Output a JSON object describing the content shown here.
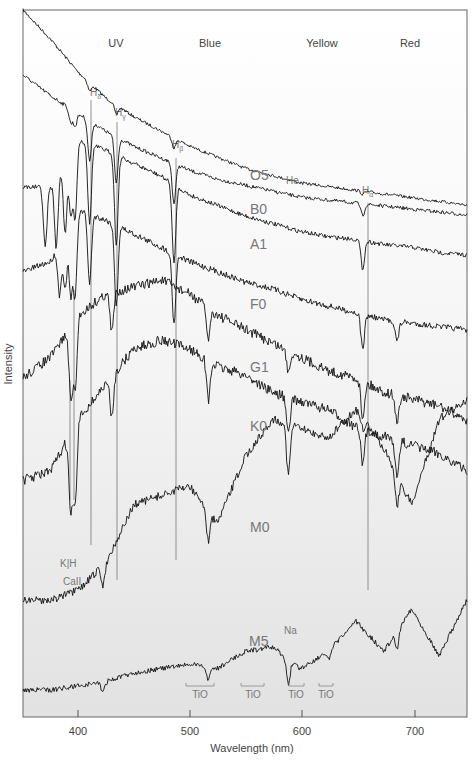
{
  "chart_data": {
    "type": "line",
    "title": "",
    "xlabel": "Wavelength (nm)",
    "ylabel": "Intensity",
    "xlim": [
      350,
      750
    ],
    "x_ticks": [
      400,
      500,
      600,
      700
    ],
    "grid": false,
    "legend": "none (series labels placed inline on curves)",
    "band_labels": [
      {
        "text": "UV",
        "x_nm": 390
      },
      {
        "text": "Blue",
        "x_nm": 487
      },
      {
        "text": "Yellow",
        "x_nm": 577
      },
      {
        "text": "Red",
        "x_nm": 660
      }
    ],
    "line_markers": [
      {
        "name": "Hδ",
        "base": "H",
        "sub": "δ",
        "x_nm": 410
      },
      {
        "name": "Hγ",
        "base": "H",
        "sub": "γ",
        "x_nm": 434
      },
      {
        "name": "Hβ",
        "base": "H",
        "sub": "β",
        "x_nm": 486
      },
      {
        "name": "Hα",
        "base": "H",
        "sub": "α",
        "x_nm": 656
      },
      {
        "name": "K",
        "x_nm": 393
      },
      {
        "name": "H",
        "x_nm": 397
      }
    ],
    "annotations": [
      {
        "text": "He",
        "x_nm": 588
      },
      {
        "text": "Na",
        "x_nm": 589
      },
      {
        "text": "K|H",
        "x_nm": 395
      },
      {
        "text": "CaII",
        "x_nm": 395
      },
      {
        "text": "TiO",
        "x_nm": [
          495,
          520
        ]
      },
      {
        "text": "TiO",
        "x_nm": [
          545,
          566
        ]
      },
      {
        "text": "TiO",
        "x_nm": [
          588,
          602
        ]
      },
      {
        "text": "TiO",
        "x_nm": [
          615,
          628
        ]
      }
    ],
    "series": [
      {
        "name": "O5",
        "note": "hot star; steep blue continuum, weak Balmer & He lines",
        "x": [
          350,
          375,
          400,
          425,
          450,
          475,
          500,
          525,
          550,
          575,
          600,
          625,
          650,
          675,
          700,
          725,
          750
        ],
        "y": [
          100,
          92,
          83,
          76,
          71,
          67,
          63,
          60,
          57,
          55,
          53,
          52,
          51,
          50,
          49,
          48,
          47
        ]
      },
      {
        "name": "B0",
        "note": "strong Balmer lines in blue, sloping continuum",
        "x": [
          350,
          375,
          400,
          425,
          450,
          475,
          500,
          525,
          550,
          575,
          600,
          625,
          650,
          675,
          700,
          725,
          750
        ],
        "y": [
          85,
          78,
          72,
          66,
          61,
          57,
          53,
          50,
          48,
          46,
          44,
          43,
          42,
          41,
          40,
          39,
          38
        ]
      },
      {
        "name": "A1",
        "note": "strongest Balmer absorption, Balmer jump near 370nm",
        "x": [
          350,
          375,
          400,
          425,
          450,
          475,
          500,
          525,
          550,
          575,
          600,
          625,
          650,
          675,
          700,
          725,
          750
        ],
        "y": [
          60,
          60,
          78,
          74,
          69,
          64,
          57,
          53,
          49,
          46,
          43,
          41,
          40,
          38,
          37,
          35,
          34
        ]
      },
      {
        "name": "F0",
        "note": "Balmer lines weakening, CaII K/H appearing",
        "x": [
          350,
          375,
          400,
          425,
          450,
          475,
          500,
          525,
          550,
          575,
          600,
          625,
          650,
          675,
          700,
          725,
          750
        ],
        "y": [
          45,
          48,
          63,
          60,
          56,
          52,
          48,
          45,
          42,
          40,
          37,
          35,
          33,
          31,
          30,
          29,
          28
        ]
      },
      {
        "name": "G1",
        "note": "sun-like; strong CaII K/H, many metal lines",
        "x": [
          350,
          375,
          400,
          425,
          450,
          475,
          500,
          525,
          550,
          575,
          600,
          625,
          650,
          675,
          700,
          725,
          750
        ],
        "y": [
          33,
          36,
          42,
          45,
          46,
          47,
          45,
          42,
          40,
          38,
          36,
          34,
          33,
          31,
          30,
          29,
          27
        ]
      },
      {
        "name": "K0",
        "note": "cooler; continuum peaks near 500nm",
        "x": [
          350,
          375,
          400,
          425,
          450,
          475,
          500,
          525,
          550,
          575,
          600,
          625,
          650,
          675,
          700,
          725,
          750
        ],
        "y": [
          24,
          25,
          31,
          35,
          39,
          40,
          39,
          37,
          36,
          34,
          33,
          32,
          30,
          29,
          28,
          27,
          25
        ]
      },
      {
        "name": "M0",
        "note": "TiO bands, Na D absorption; peak in red",
        "x": [
          350,
          375,
          400,
          425,
          450,
          475,
          500,
          525,
          550,
          575,
          600,
          625,
          650,
          675,
          700,
          725,
          750
        ],
        "y": [
          12,
          12,
          13,
          16,
          22,
          23,
          24,
          20,
          27,
          31,
          30,
          29,
          32,
          28,
          22,
          31,
          33
        ]
      },
      {
        "name": "M5",
        "note": "coolest; deep TiO bands, intensity rises into red",
        "x": [
          350,
          375,
          400,
          425,
          450,
          475,
          500,
          525,
          550,
          575,
          600,
          625,
          650,
          675,
          700,
          725,
          750
        ],
        "y": [
          3,
          3,
          4,
          5,
          7,
          8,
          9,
          8,
          12,
          13,
          8,
          12,
          19,
          12,
          22,
          11,
          24
        ]
      }
    ]
  },
  "labels": {
    "ylabel": "Intensity",
    "xlabel": "Wavelength (nm)",
    "ticks": [
      "400",
      "500",
      "600",
      "700"
    ],
    "bands": [
      "UV",
      "Blue",
      "Yellow",
      "Red"
    ],
    "classes": [
      "O5",
      "B0",
      "A1",
      "F0",
      "G1",
      "K0",
      "M0",
      "M5"
    ],
    "he": "He",
    "na": "Na",
    "kh": "K|H",
    "ca": "CaII",
    "tio": "TiO",
    "h_base": "H",
    "h_delta": "δ",
    "h_gamma": "γ",
    "h_beta": "β",
    "h_alpha": "α"
  },
  "colors": {
    "background_top": "#ffffff",
    "background_bottom": "#e4e4e4",
    "curve": "#111111",
    "marker_line": "#666666",
    "label": "#777777",
    "axis": "#555555"
  }
}
